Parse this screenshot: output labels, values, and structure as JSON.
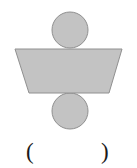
{
  "figure": {
    "background_color": "#ffffff",
    "fill_color": "#c3c3c3",
    "stroke_color": "#909090",
    "stroke_width": 1,
    "shapes": [
      {
        "name": "top-circle",
        "type": "circle",
        "cx": 70,
        "cy": 30,
        "r": 18,
        "fill": "#c3c3c3",
        "stroke": "#909090"
      },
      {
        "name": "bottom-circle",
        "type": "circle",
        "cx": 70,
        "cy": 111,
        "r": 18,
        "fill": "#c3c3c3",
        "stroke": "#909090"
      },
      {
        "name": "trapezoid",
        "type": "polygon",
        "points": "15,49 122,49 109,93 29,93",
        "top_width": 107,
        "bottom_width": 80,
        "height": 44,
        "fill": "#c3c3c3",
        "stroke": "#909090"
      }
    ]
  },
  "answer": {
    "open_paren": "(",
    "close_paren": ")",
    "value": "",
    "placeholder": ""
  }
}
